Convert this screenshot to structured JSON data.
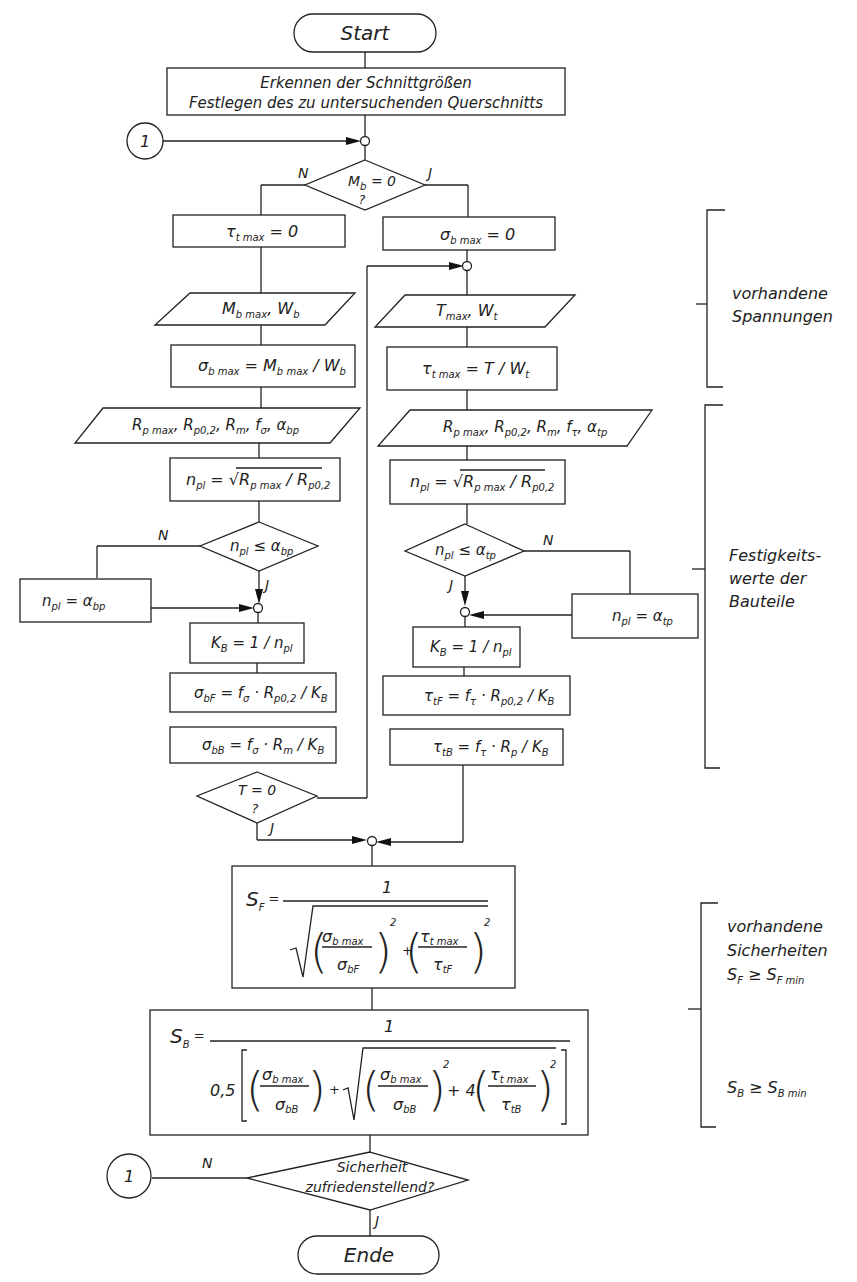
{
  "terminals": {
    "start": "Start",
    "end": "Ende"
  },
  "process": {
    "intro_line1": "Erkennen der Schnittgrößen",
    "intro_line2": "Festlegen des zu untersuchenden Querschnitts"
  },
  "connector": {
    "label": "1"
  },
  "branch_labels": {
    "no": "N",
    "yes": "J"
  },
  "decisions": {
    "mb_zero": {
      "main": "M",
      "sub": "b",
      "rest": " = 0",
      "q": "?"
    },
    "npl_abp": {
      "main": "n",
      "sub": "pl",
      "op": " ≤ α",
      "sub2": "bp"
    },
    "npl_atp": {
      "main": "n",
      "sub": "pl",
      "op": " ≤ α",
      "sub2": "tp"
    },
    "t_zero": {
      "line1": "T = 0",
      "q": "?"
    },
    "safety": {
      "line1": "Sicherheit",
      "line2": "zufriedenstellend?"
    }
  },
  "left_column": {
    "tau_zero": {
      "sym": "τ",
      "sub": "t max",
      "rest": " = 0"
    },
    "input_mb": {
      "a": "M",
      "a_sub": "b max",
      "sep": ", ",
      "b": "W",
      "b_sub": "b"
    },
    "sigma_calc": {
      "a": "σ",
      "a_sub": "b max",
      "eq": " = M",
      "b_sub": "b max",
      "div": " / W",
      "c_sub": "b"
    },
    "input_material": {
      "t1": "R",
      "s1": "p max",
      "t2": ", R",
      "s2": "p0,2",
      "t3": ", R",
      "s3": "m",
      "t4": ", f",
      "s4": "σ",
      "t5": ", α",
      "s5": "bp"
    },
    "npl_calc": {
      "a": "n",
      "a_sub": "pl",
      "eq": " = √",
      "b": "R",
      "b_sub": "p max",
      "div": " / R",
      "c_sub": "p0,2"
    },
    "npl_set": {
      "a": "n",
      "a_sub": "pl",
      "eq": " = α",
      "b_sub": "bp"
    },
    "kb": {
      "a": "K",
      "a_sub": "B",
      "eq": " = 1 / n",
      "b_sub": "pl"
    },
    "sigma_bf": {
      "a": "σ",
      "a_sub": "bF",
      "eq": " = f",
      "b_sub": "σ",
      "mid": " · R",
      "c_sub": "p0,2",
      "div": " / K",
      "d_sub": "B"
    },
    "sigma_bb": {
      "a": "σ",
      "a_sub": "bB",
      "eq": " = f",
      "b_sub": "σ",
      "mid": " · R",
      "c_sub": "m",
      "div": " / K",
      "d_sub": "B"
    }
  },
  "right_column": {
    "sigma_zero": {
      "sym": "σ",
      "sub": "b max",
      "rest": " = 0"
    },
    "input_t": {
      "a": "T",
      "a_sub": "max",
      "sep": ", ",
      "b": "W",
      "b_sub": "t"
    },
    "tau_calc": {
      "a": "τ",
      "a_sub": "t max",
      "eq": " = T / W",
      "b_sub": "t"
    },
    "input_material": {
      "t1": "R",
      "s1": "p max",
      "t2": ", R",
      "s2": "p0,2",
      "t3": ", R",
      "s3": "m",
      "t4": ", f",
      "s4": "τ",
      "t5": ", α",
      "s5": "tp"
    },
    "npl_calc": {
      "a": "n",
      "a_sub": "pl",
      "eq": " = √",
      "b": "R",
      "b_sub": "p max",
      "div": " / R",
      "c_sub": "p0,2"
    },
    "npl_set": {
      "a": "n",
      "a_sub": "pl",
      "eq": " = α",
      "b_sub": "tp"
    },
    "kb": {
      "a": "K",
      "a_sub": "B",
      "eq": " = 1 / n",
      "b_sub": "pl"
    },
    "tau_tf": {
      "a": "τ",
      "a_sub": "tF",
      "eq": " = f",
      "b_sub": "τ",
      "mid": " · R",
      "c_sub": "p0,2",
      "div": " / K",
      "d_sub": "B"
    },
    "tau_tb": {
      "a": "τ",
      "a_sub": "tB",
      "eq": " = f",
      "b_sub": "τ",
      "mid": " · R",
      "c_sub": "p",
      "div": " / K",
      "d_sub": "B"
    }
  },
  "formulas": {
    "sf": {
      "lhs": "S",
      "lhs_sub": "F",
      "eq": " =",
      "num": "1",
      "f1_num": "σ",
      "f1_num_sub": "b max",
      "f1_den": "σ",
      "f1_den_sub": "bF",
      "plus": "+",
      "exp": "2",
      "f2_num": "τ",
      "f2_num_sub": "t max",
      "f2_den": "τ",
      "f2_den_sub": "tF"
    },
    "sb": {
      "lhs": "S",
      "lhs_sub": "B",
      "eq": " =",
      "num": "1",
      "factor": "0,5",
      "f1_num": "σ",
      "f1_num_sub": "b max",
      "f1_den": "σ",
      "f1_den_sub": "bB",
      "plus": "+",
      "exp": "2",
      "four": "+ 4",
      "f3_num": "τ",
      "f3_num_sub": "t max",
      "f3_den": "τ",
      "f3_den_sub": "tB"
    }
  },
  "annotations": {
    "stresses": {
      "line1": "vorhandene",
      "line2": "Spannungen"
    },
    "strength": {
      "line1": "Festigkeits-",
      "line2": "werte der",
      "line3": "Bauteile"
    },
    "safety": {
      "line1": "vorhandene",
      "line2": "Sicherheiten",
      "sf": "S",
      "sf_sub": "F",
      "sf_op": " ≥ S",
      "sf_min_sub": "F min",
      "sb": "S",
      "sb_sub": "B",
      "sb_op": " ≥ S",
      "sb_min_sub": "B min"
    }
  }
}
